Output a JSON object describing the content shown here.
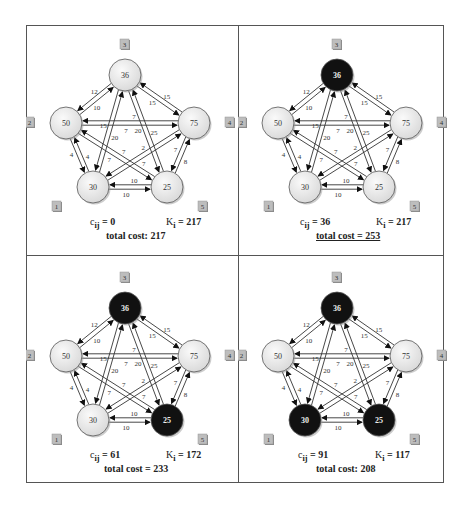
{
  "figure": {
    "node_template": [
      {
        "id": "1",
        "value": "30",
        "x": 67,
        "y": 162
      },
      {
        "id": "2",
        "value": "50",
        "x": 40,
        "y": 98
      },
      {
        "id": "3",
        "value": "36",
        "x": 99,
        "y": 50
      },
      {
        "id": "4",
        "value": "75",
        "x": 168,
        "y": 98
      },
      {
        "id": "5",
        "value": "25",
        "x": 141,
        "y": 162
      }
    ],
    "edges": [
      {
        "from": "2",
        "to": "3",
        "label_fwd": "10",
        "label_back": "12"
      },
      {
        "from": "3",
        "to": "4",
        "label_fwd": "15",
        "label_back": "15"
      },
      {
        "from": "2",
        "to": "4",
        "label_fwd": "7",
        "label_back": "7"
      },
      {
        "from": "3",
        "to": "1",
        "label_fwd": "15",
        "label_back": "20"
      },
      {
        "from": "3",
        "to": "5",
        "label_fwd": "20",
        "label_back": "25"
      },
      {
        "from": "2",
        "to": "1",
        "label_fwd": "4",
        "label_back": "4"
      },
      {
        "from": "4",
        "to": "5",
        "label_fwd": "7",
        "label_back": "8"
      },
      {
        "from": "1",
        "to": "5",
        "label_fwd": "10",
        "label_back": "10"
      },
      {
        "from": "2",
        "to": "5",
        "label_fwd": "7",
        "label_back": "7"
      },
      {
        "from": "1",
        "to": "4",
        "label_fwd": "7",
        "label_back": "2"
      }
    ],
    "colors": {
      "node_light": "#ececec",
      "node_dark": "#111111",
      "edge": "#333333",
      "frame": "#555555",
      "tag_bg": "#bdbdbd"
    },
    "panels": [
      {
        "position": "top-left",
        "selected_nodes": [],
        "cij_label": "c",
        "cij_sub": "ij",
        "cij_value": " = 0",
        "ki_label": "K",
        "ki_sub": "i",
        "ki_value": " = 217",
        "total": "total cost: 217",
        "total_underlined": false
      },
      {
        "position": "top-right",
        "selected_nodes": [
          "3"
        ],
        "cij_label": "c",
        "cij_sub": "ij",
        "cij_value": " = 36",
        "ki_label": "K",
        "ki_sub": "i",
        "ki_value": " = 217",
        "total": "total cost = 253",
        "total_underlined": true
      },
      {
        "position": "bottom-left",
        "selected_nodes": [
          "3",
          "5"
        ],
        "cij_label": "c",
        "cij_sub": "ij",
        "cij_value": " = 61",
        "ki_label": "K",
        "ki_sub": "i",
        "ki_value": " = 172",
        "total": "total cost = 233",
        "total_underlined": false
      },
      {
        "position": "bottom-right",
        "selected_nodes": [
          "3",
          "5",
          "1"
        ],
        "cij_label": "c",
        "cij_sub": "ij",
        "cij_value": " = 91",
        "ki_label": "K",
        "ki_sub": "i",
        "ki_value": " = 117",
        "total": "total cost: 208",
        "total_underlined": false
      }
    ]
  }
}
